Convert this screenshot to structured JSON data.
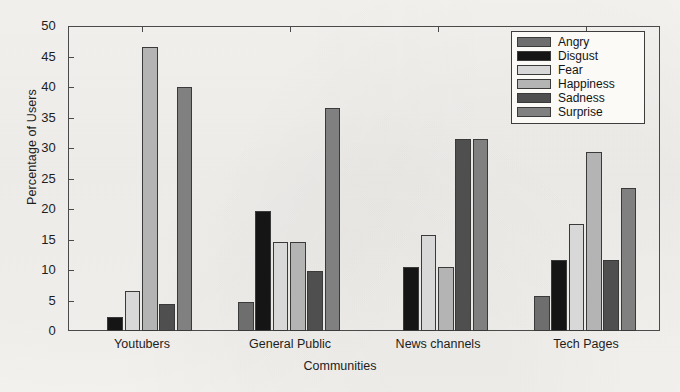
{
  "chart_data": {
    "type": "bar",
    "title": "",
    "xlabel": "Communities",
    "ylabel": "Percentage of Users",
    "categories": [
      "Youtubers",
      "General Public",
      "News channels",
      "Tech Pages"
    ],
    "series": [
      {
        "name": "Angry",
        "color": "#6e6e6e",
        "values": [
          0.0,
          4.8,
          0.0,
          5.8
        ]
      },
      {
        "name": "Disgust",
        "color": "#151515",
        "values": [
          2.3,
          19.6,
          10.5,
          11.6
        ]
      },
      {
        "name": "Fear",
        "color": "#d8d8d8",
        "values": [
          6.5,
          14.6,
          15.8,
          17.6
        ]
      },
      {
        "name": "Happiness",
        "color": "#b4b4b4",
        "values": [
          46.5,
          14.6,
          10.5,
          29.4
        ]
      },
      {
        "name": "Sadness",
        "color": "#4f4f4f",
        "values": [
          4.4,
          9.8,
          31.5,
          11.6
        ]
      },
      {
        "name": "Surprise",
        "color": "#808080",
        "values": [
          40.0,
          36.5,
          31.5,
          23.4
        ]
      }
    ],
    "ylim": [
      0,
      50
    ],
    "yticks": [
      0,
      5,
      10,
      15,
      20,
      25,
      30,
      35,
      40,
      45,
      50
    ],
    "ytick_labels": [
      "0",
      "5",
      "10",
      "15",
      "20",
      "25",
      "30",
      "35",
      "40",
      "45",
      "50"
    ],
    "grid": false,
    "legend_position": "top-right",
    "legend_entries": [
      "Angry",
      "Disgust",
      "Fear",
      "Happiness",
      "Sadness",
      "Surprise"
    ],
    "axis_color": "#4a4a4a",
    "background_color": "#f4f3f0"
  }
}
